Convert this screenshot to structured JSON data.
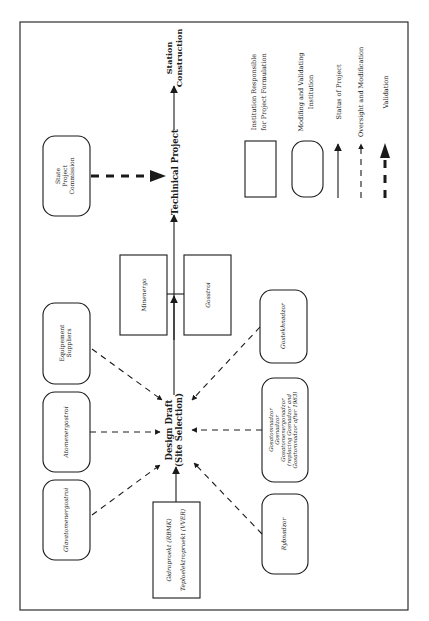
{
  "diagram": {
    "orientation": "rotated 90° counter-clockwise",
    "nodes": {
      "design_draft": {
        "line1": "Design Draft",
        "line2": "(Site Selection)"
      },
      "technical_project": "Techinical Project",
      "station_construction": {
        "line1": "Station",
        "line2": "Construction"
      },
      "state_project_commission": {
        "line1": "State",
        "line2": "Project",
        "line3": "Commission"
      },
      "equipment_suppliers": {
        "line1": "Equipement",
        "line2": "Suppliers"
      },
      "atomenergostroi": "Atomenergostroi",
      "glavatomenergostroi": "Glavatomenergostroi",
      "gidroproekt": {
        "line1": "Gidroproekt (RBMK)",
        "line2": "Teploelektroproekt (VVER)"
      },
      "minenergo": "Minenergo",
      "gosstroi": "Gosstroi",
      "gostekhnadzor": "Gostekhnadzor",
      "gosatomnadzor_group": {
        "line1": "Gosatomnadzor",
        "line2": "Gosnadzor",
        "line3": "Gosatomenergonadzor",
        "line4": "(replacing Gosnadzor and",
        "line5": "Gosatomnadzor after 1983)"
      },
      "rybnadzor": "Rybnadzor"
    },
    "legend": {
      "rect_label": {
        "line1": "Institution Responsible",
        "line2": "for Project Formulation"
      },
      "rounded_label": {
        "line1": "Modifing and Validating",
        "line2": "Institution"
      },
      "solid_arrow_label": "Status of Project",
      "dashed_arrow_label": "Oversight and Modification",
      "thick_dashed_arrow_label": "Validation"
    },
    "colors": {
      "line": "#1a1a1a",
      "background": "#ffffff"
    }
  }
}
